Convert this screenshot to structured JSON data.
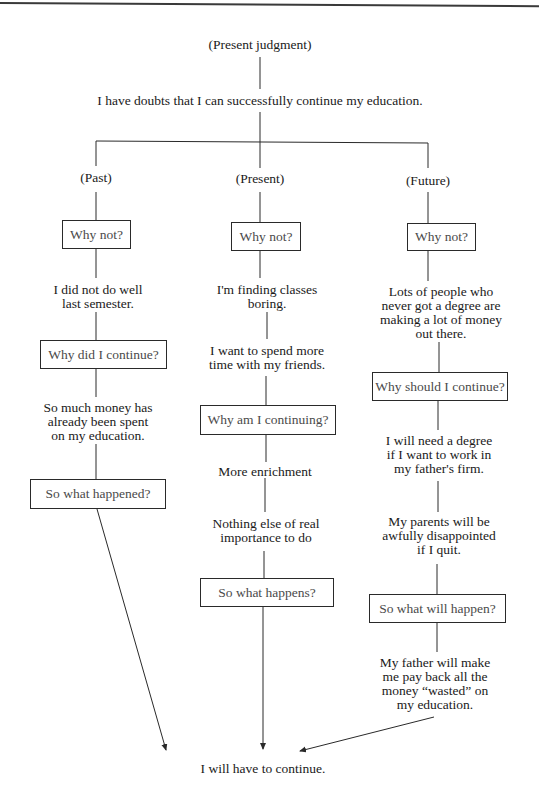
{
  "root": {
    "label": "(Present judgment)",
    "statement": "I have doubts that I can successfully continue my education."
  },
  "columns": {
    "past": {
      "label": "(Past)",
      "q1": "Why not?",
      "a1": [
        "I did not do well",
        "last semester."
      ],
      "q2": "Why did I continue?",
      "a2": [
        "So much money has",
        "already been spent",
        "on my education."
      ],
      "q3": "So what happened?"
    },
    "present": {
      "label": "(Present)",
      "q1": "Why not?",
      "a1a": [
        "I'm finding classes",
        "boring."
      ],
      "a1b": [
        "I want to spend more",
        "time with my friends."
      ],
      "q2": "Why am I continuing?",
      "a2a": "More enrichment",
      "a2b": [
        "Nothing else of real",
        "importance to do"
      ],
      "q3": "So what happens?"
    },
    "future": {
      "label": "(Future)",
      "q1": "Why not?",
      "a1": [
        "Lots of people who",
        "never got a degree are",
        "making a lot of money",
        "out there."
      ],
      "q2": "Why should I continue?",
      "a2a": [
        "I will need a degree",
        "if I want to work in",
        "my father's firm."
      ],
      "a2b": [
        "My parents will be",
        "awfully disappointed",
        "if I quit."
      ],
      "q3": "So what will happen?",
      "a3": [
        "My father will make",
        "me pay back all the",
        "money “wasted” on",
        "my education."
      ]
    }
  },
  "conclusion": "I will have to continue.",
  "colors": {
    "line": "#2a2a2a",
    "text": "#1a1a1a",
    "box_text": "#4a4a4a"
  }
}
